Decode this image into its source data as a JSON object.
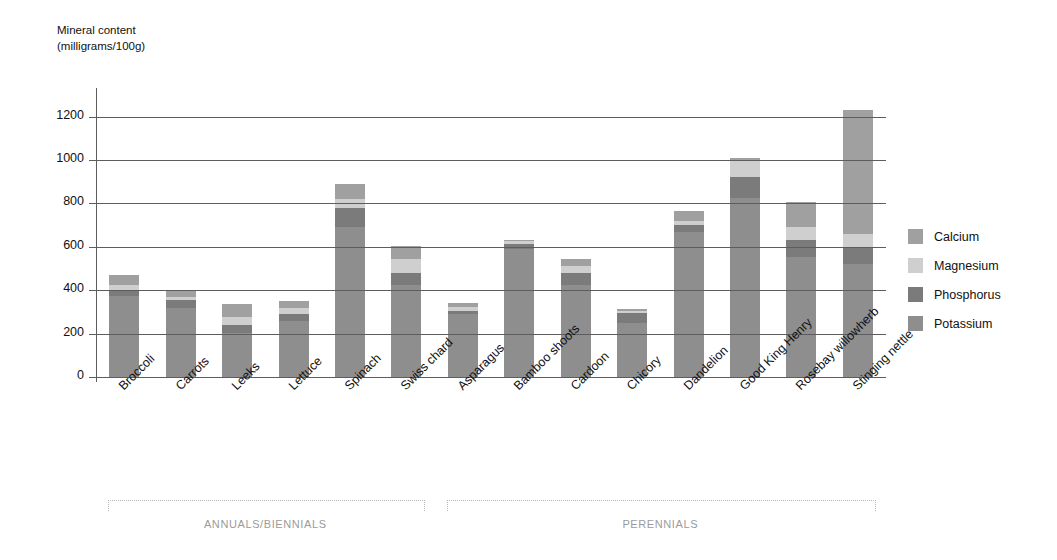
{
  "chart_data": {
    "type": "bar",
    "stacked": true,
    "title": "",
    "ylabel": "Mineral content (milligrams/100g)",
    "xlabel": "",
    "ylim": [
      0,
      1300
    ],
    "yticks": [
      0,
      200,
      400,
      600,
      800,
      1000,
      1200
    ],
    "grid": true,
    "legend_position": "right",
    "categories": [
      "Broccoli",
      "Carrots",
      "Leeks",
      "Lettuce",
      "Spinach",
      "Swiss chard",
      "Asparagus",
      "Bamboo shoots",
      "Cardoon",
      "Chicory",
      "Dandelion",
      "Good King Henry",
      "Rosebay willowherb",
      "Stinging nettle"
    ],
    "series": [
      {
        "name": "Potassium",
        "color": "#8e8e8e",
        "values": [
          375,
          320,
          205,
          260,
          690,
          425,
          290,
          590,
          425,
          250,
          670,
          825,
          555,
          520
        ]
      },
      {
        "name": "Phosphorus",
        "color": "#7b7b7b",
        "values": [
          25,
          35,
          35,
          30,
          90,
          55,
          15,
          25,
          55,
          45,
          30,
          95,
          75,
          80
        ]
      },
      {
        "name": "Magnesium",
        "color": "#cfcfcf",
        "values": [
          25,
          15,
          35,
          30,
          40,
          65,
          20,
          10,
          30,
          10,
          20,
          80,
          60,
          60
        ]
      },
      {
        "name": "Calcium",
        "color": "#a0a0a0",
        "values": [
          45,
          30,
          60,
          30,
          70,
          60,
          15,
          5,
          35,
          10,
          45,
          10,
          115,
          570
        ]
      }
    ],
    "totals": [
      470,
      400,
      335,
      350,
      890,
      605,
      340,
      630,
      545,
      315,
      765,
      1010,
      805,
      1230
    ],
    "groups": [
      {
        "label": "ANNUALS/BIENNIALS",
        "start": 0,
        "end": 5
      },
      {
        "label": "PERENNIALS",
        "start": 6,
        "end": 13
      }
    ]
  },
  "legend": {
    "items": [
      {
        "label": "Calcium",
        "color": "#a0a0a0"
      },
      {
        "label": "Magnesium",
        "color": "#cfcfcf"
      },
      {
        "label": "Phosphorus",
        "color": "#7b7b7b"
      },
      {
        "label": "Potassium",
        "color": "#8e8e8e"
      }
    ]
  }
}
